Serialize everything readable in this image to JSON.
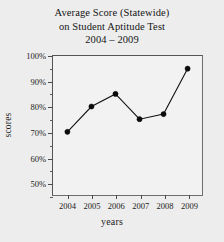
{
  "chart_data": {
    "type": "line",
    "title": "Average Score (Statewide) on Student Aptitude Test 2004 – 2009",
    "title_lines": [
      "Average Score (Statewide)",
      "on Student Aptitude Test",
      "2004 – 2009"
    ],
    "xlabel": "years",
    "ylabel": "scores",
    "categories": [
      "2004",
      "2005",
      "2006",
      "2007",
      "2008",
      "2009"
    ],
    "values": [
      70,
      80,
      85,
      75,
      77,
      95
    ],
    "ylim": [
      45,
      100
    ],
    "xlim": [
      2003.4,
      2009.6
    ],
    "ytick_labels": [
      "50%",
      "60%",
      "70%",
      "80%",
      "90%",
      "100%"
    ],
    "ytick_values": [
      50,
      60,
      70,
      80,
      90,
      100
    ],
    "yminor_values": [
      45,
      55,
      65,
      75,
      85,
      95
    ],
    "grid": false,
    "legend": "none",
    "series_color": "#111111",
    "marker_color": "#0b0b0b",
    "axis_color": "#555555",
    "background_color": "#ededed"
  }
}
